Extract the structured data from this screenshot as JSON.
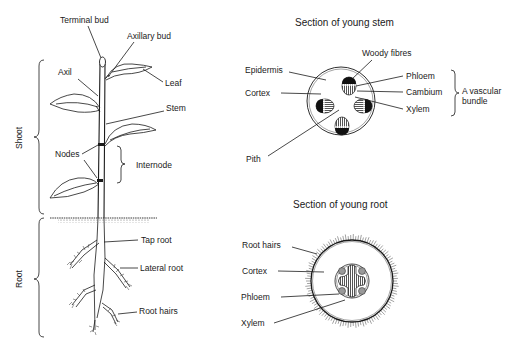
{
  "plant": {
    "labels": {
      "terminal_bud": "Terminal bud",
      "axillary_bud": "Axillary bud",
      "axil": "Axil",
      "leaf": "Leaf",
      "stem": "Stem",
      "nodes": "Nodes",
      "internode": "Internode",
      "tap_root": "Tap root",
      "lateral_root": "Lateral root",
      "root_hairs": "Root hairs"
    },
    "regions": {
      "shoot": "Shoot",
      "root": "Root"
    }
  },
  "stem_section": {
    "title": "Section of young stem",
    "labels": {
      "woody_fibres": "Woody fibres",
      "epidermis": "Epidermis",
      "phloem": "Phloem",
      "cortex": "Cortex",
      "cambium": "Cambium",
      "xylem": "Xylem",
      "pith": "Pith",
      "vascular_bundle_line1": "A vascular",
      "vascular_bundle_line2": "bundle"
    }
  },
  "root_section": {
    "title": "Section of young root",
    "labels": {
      "root_hairs": "Root hairs",
      "cortex": "Cortex",
      "phloem": "Phloem",
      "xylem": "Xylem"
    }
  }
}
